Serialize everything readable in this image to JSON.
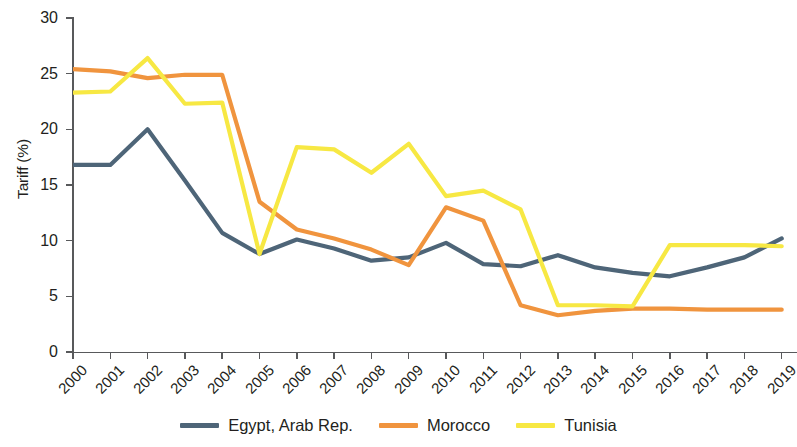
{
  "chart_data": {
    "type": "line",
    "title": "",
    "xlabel": "",
    "ylabel": "Tariff (%)",
    "ylim": [
      0,
      30
    ],
    "yticks": [
      0,
      5,
      10,
      15,
      20,
      25,
      30
    ],
    "ytick_labels": [
      "0",
      "5",
      "10",
      "15",
      "20",
      "25",
      "30"
    ],
    "grid": false,
    "legend_position": "bottom-center",
    "categories": [
      "2000",
      "2001",
      "2002",
      "2003",
      "2004",
      "2005",
      "2006",
      "2007",
      "2008",
      "2009",
      "2010",
      "2011",
      "2012",
      "2013",
      "2014",
      "2015",
      "2016",
      "2017",
      "2018",
      "2019"
    ],
    "x_tick_labels": [
      "2000",
      "2001",
      "2002",
      "2003",
      "2004",
      "2005",
      "2006",
      "2007",
      "2008",
      "2009",
      "2010",
      "2011",
      "2012",
      "2013",
      "2014",
      "2015",
      "2016",
      "2017",
      "2018",
      "2019"
    ],
    "series": [
      {
        "name": "Egypt, Arab Rep.",
        "color": "#4e6578",
        "values": [
          16.8,
          16.8,
          20.0,
          15.4,
          10.7,
          8.8,
          10.1,
          9.3,
          8.2,
          8.5,
          9.8,
          7.9,
          7.7,
          8.7,
          7.6,
          7.1,
          6.8,
          7.6,
          8.5,
          10.2
        ]
      },
      {
        "name": "Morocco",
        "color": "#f0943e",
        "values": [
          25.4,
          25.2,
          24.6,
          24.9,
          24.9,
          13.5,
          11.0,
          10.2,
          9.2,
          7.8,
          13.0,
          11.8,
          4.2,
          3.3,
          3.7,
          3.9,
          3.9,
          3.8,
          3.8,
          3.8
        ]
      },
      {
        "name": "Tunisia",
        "color": "#f7e843",
        "values": [
          23.3,
          23.4,
          26.4,
          22.3,
          22.4,
          8.8,
          18.4,
          18.2,
          16.1,
          18.7,
          14.0,
          14.5,
          12.8,
          4.2,
          4.2,
          4.1,
          9.6,
          9.6,
          9.6,
          9.5
        ]
      }
    ]
  },
  "axis": {
    "y_title": "Tariff (%)"
  },
  "legend": {
    "items": [
      {
        "label": "Egypt, Arab Rep.",
        "color": "#4e6578"
      },
      {
        "label": "Morocco",
        "color": "#f0943e"
      },
      {
        "label": "Tunisia",
        "color": "#f7e843"
      }
    ]
  }
}
